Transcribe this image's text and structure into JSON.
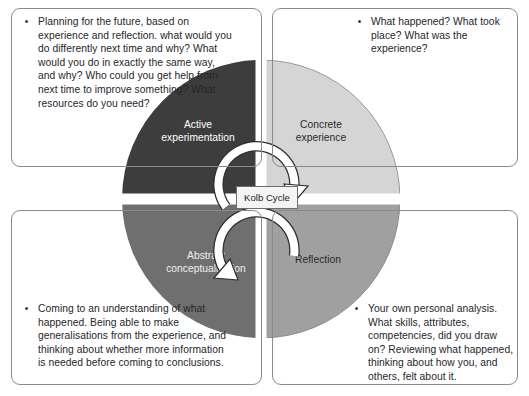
{
  "diagram": {
    "title": "Kolb Cycle",
    "center_label": "Kolb Cycle",
    "type": "experiential-learning-cycle"
  },
  "wheel": {
    "segments": [
      {
        "id": "active-experimentation",
        "label_line1": "Active",
        "label_line2": "experimentation",
        "position": "top-left",
        "color": "#3d3d3d",
        "text_color": "#ffffff"
      },
      {
        "id": "concrete-experience",
        "label_line1": "Concrete",
        "label_line2": "experience",
        "position": "top-right",
        "color": "#d5d5d5",
        "text_color": "#2b2b2b"
      },
      {
        "id": "abstract-conceptualisation",
        "label_line1": "Abstract",
        "label_line2": "conceptualisation",
        "position": "bottom-left",
        "color": "#6f6f6f",
        "text_color": "#f0f0f0"
      },
      {
        "id": "reflection",
        "label_line1": "Reflection",
        "label_line2": "",
        "position": "bottom-right",
        "color": "#a0a0a0",
        "text_color": "#2b2b2b"
      }
    ],
    "arrows": [
      {
        "id": "upper-arrow",
        "direction": "clockwise",
        "color": "#ffffff"
      },
      {
        "id": "lower-arrow",
        "direction": "clockwise",
        "color": "#ffffff"
      }
    ]
  },
  "panels": {
    "top_left": {
      "bullet": "•",
      "text": "Planning for the future, based on experience and reflection. what would you do differently next time and why? What would you do in exactly the same way, and why? Who could you get help from next time to improve something? What resources do you need?"
    },
    "top_right": {
      "bullet": "•",
      "text": "What happened? What took place? What was the experience?"
    },
    "bottom_left": {
      "bullet": "•",
      "text": "Coming to an understanding of what happened. Being able to make generalisations from the experience, and thinking about whether more information is needed before coming to conclusions."
    },
    "bottom_right": {
      "bullet": "•",
      "text": "Your own personal analysis. What skills, attributes, competencies, did you draw on? Reviewing what happened, thinking about how you, and others, felt about it."
    }
  },
  "colors": {
    "panel_border": "#8a8a8a",
    "background": "#ffffff",
    "body_text": "#26262a",
    "divider": "#ffffff"
  }
}
